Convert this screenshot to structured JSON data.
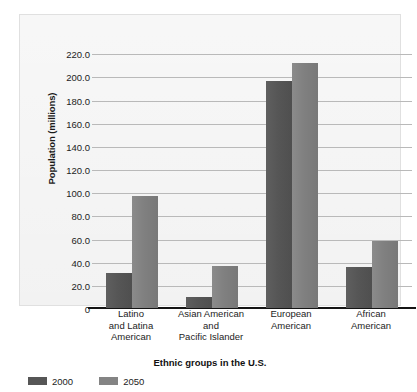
{
  "chart_data": {
    "type": "bar",
    "title": "",
    "xlabel": "Ethnic groups in the U.S.",
    "ylabel": "Population (millions)",
    "categories": [
      "Latino\nand Latina\nAmerican",
      "Asian American\nand\nPacific Islander",
      "European\nAmerican",
      "African\nAmerican"
    ],
    "category_lines": [
      [
        "Latino",
        "and Latina",
        "American"
      ],
      [
        "Asian American",
        "and",
        "Pacific Islander"
      ],
      [
        "European",
        "American"
      ],
      [
        "African",
        "American"
      ]
    ],
    "series": [
      {
        "name": "2000",
        "color": "#565656",
        "values": [
          30,
          9.5,
          196,
          35
        ]
      },
      {
        "name": "2050",
        "color": "#808080",
        "values": [
          97,
          36,
          212,
          58
        ]
      }
    ],
    "ylim": [
      0,
      228
    ],
    "yticks": [
      0,
      20,
      40,
      60,
      80,
      100,
      120,
      140,
      160,
      180,
      200,
      220
    ],
    "ytick_labels": [
      "0",
      "20.0",
      "40.0",
      "60.0",
      "80.0",
      "100.0",
      "120.0",
      "140.0",
      "160.0",
      "180.0",
      "200.0",
      "220.0"
    ],
    "grid": true,
    "legend_position": "bottom-left",
    "panel_background": "#eeeeee",
    "grid_color": "#b9b9b9",
    "axis_color": "#141414"
  }
}
